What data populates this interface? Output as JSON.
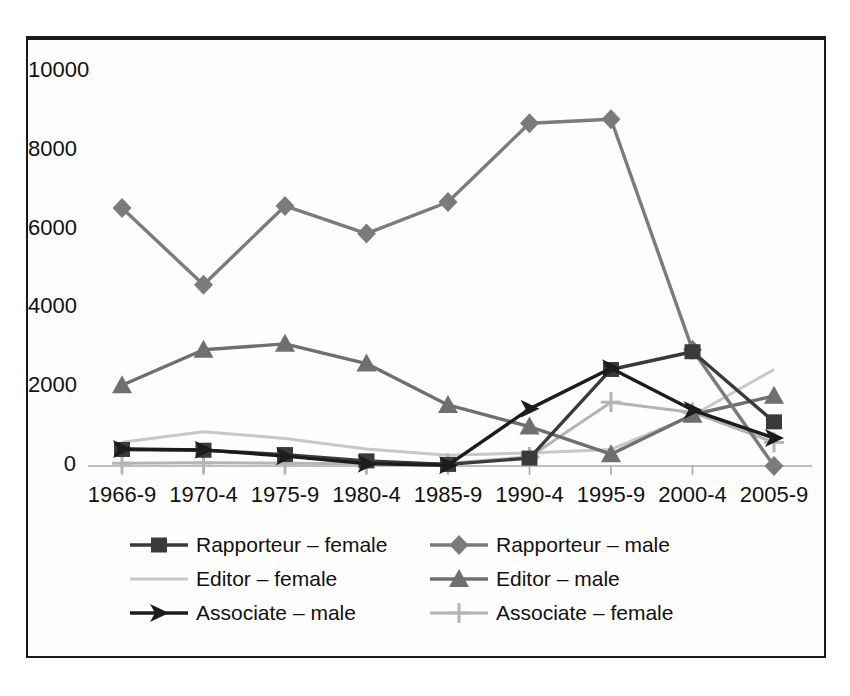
{
  "chart_data": {
    "type": "line",
    "title": "",
    "subtitle": "",
    "xlabel": "",
    "ylabel": "",
    "grid": false,
    "legend_position": "bottom",
    "categories": [
      "1966-9",
      "1970-4",
      "1975-9",
      "1980-4",
      "1985-9",
      "1990-4",
      "1995-9",
      "2000-4",
      "2005-9"
    ],
    "ylim": [
      0,
      10000
    ],
    "yticks": [
      "0",
      "2000",
      "4000",
      "6000",
      "8000",
      "10000"
    ],
    "ytick_values": [
      0,
      2000,
      4000,
      6000,
      8000,
      10000
    ],
    "series": [
      {
        "name": "Rapporteur – female",
        "marker": "square",
        "color": "#3a3a3a",
        "values": [
          420,
          400,
          290,
          130,
          40,
          200,
          2450,
          2900,
          1120
        ]
      },
      {
        "name": "Rapporteur – male",
        "marker": "diamond",
        "color": "#7b7b7b",
        "values": [
          6550,
          4600,
          6600,
          5900,
          6700,
          8700,
          8800,
          2950,
          0
        ]
      },
      {
        "name": "Editor – female",
        "marker": "none",
        "color": "#c8c8c8",
        "values": [
          600,
          870,
          700,
          430,
          270,
          330,
          420,
          1280,
          2450
        ]
      },
      {
        "name": "Editor – male",
        "marker": "triangle",
        "color": "#6f6f6f",
        "values": [
          2050,
          2950,
          3100,
          2600,
          1550,
          1000,
          300,
          1300,
          1780
        ]
      },
      {
        "name": "Associate – male",
        "marker": "arrow",
        "color": "#1c1c1c",
        "values": [
          430,
          410,
          250,
          60,
          20,
          1450,
          2480,
          1420,
          710
        ]
      },
      {
        "name": "Associate – female",
        "marker": "cross",
        "color": "#b4b4b4",
        "values": [
          70,
          80,
          70,
          60,
          70,
          230,
          1620,
          1360,
          600
        ]
      }
    ]
  },
  "legend": {
    "items": [
      {
        "label": "Rapporteur – female",
        "marker": "square",
        "color": "#3a3a3a"
      },
      {
        "label": "Rapporteur – male",
        "marker": "diamond",
        "color": "#7b7b7b"
      },
      {
        "label": "Editor – female",
        "marker": "none",
        "color": "#c8c8c8"
      },
      {
        "label": "Editor – male",
        "marker": "triangle",
        "color": "#6f6f6f"
      },
      {
        "label": "Associate – male",
        "marker": "arrow",
        "color": "#1c1c1c"
      },
      {
        "label": "Associate – female",
        "marker": "cross",
        "color": "#b4b4b4"
      }
    ]
  },
  "axis_colors": {
    "axis_line": "#a9a9a9",
    "frame": "#1a1a1a",
    "tick_text": "#111111"
  }
}
